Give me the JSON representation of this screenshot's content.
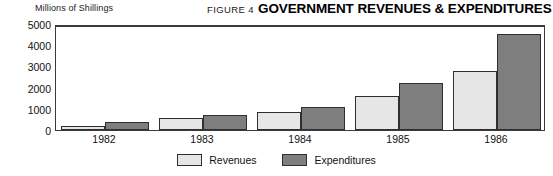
{
  "header": {
    "unit_label": "Millions of Shillings",
    "figure_number": "FIGURE 4",
    "title": "GOVERNMENT REVENUES & EXPENDITURES"
  },
  "legend": {
    "items": [
      {
        "label": "Revenues",
        "color": "#e6e6e6"
      },
      {
        "label": "Expenditures",
        "color": "#7e7e7e"
      }
    ]
  },
  "chart_data": {
    "type": "bar",
    "title": "GOVERNMENT REVENUES & EXPENDITURES",
    "subtitle": "FIGURE 4",
    "xlabel": "",
    "ylabel": "Millions of Shillings",
    "categories": [
      "1982",
      "1983",
      "1984",
      "1985",
      "1986"
    ],
    "series": [
      {
        "name": "Revenues",
        "color": "#e6e6e6",
        "values": [
          200,
          550,
          850,
          1600,
          2800
        ]
      },
      {
        "name": "Expenditures",
        "color": "#7e7e7e",
        "values": [
          400,
          700,
          1100,
          2200,
          4550
        ]
      }
    ],
    "ylim": [
      0,
      5000
    ],
    "yticks": [
      0,
      1000,
      2000,
      3000,
      4000,
      5000
    ],
    "ytick_labels": [
      "0",
      "1000",
      "2000",
      "3000",
      "4000",
      "5000"
    ],
    "grid": false,
    "legend_position": "bottom-center"
  }
}
